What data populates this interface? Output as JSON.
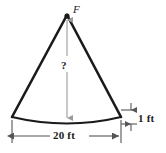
{
  "figure": {
    "kind": "geometry-diagram",
    "colors": {
      "background": "#ffffff",
      "outline": "#1a1a1a",
      "dimension_line": "#9a9a9a",
      "text": "#1a1a1a"
    },
    "labels": {
      "apex_point": "F",
      "height_dimension": "?",
      "base_dimension": "20 ft",
      "sagitta_dimension": "1 ft"
    },
    "geometry": {
      "apex": {
        "x": 67,
        "y": 15
      },
      "left_vertex": {
        "x": 12,
        "y": 117
      },
      "right_vertex": {
        "x": 121,
        "y": 117
      },
      "arc_lowest": {
        "x": 67,
        "y": 123
      },
      "base_dimension_y": 136,
      "sagitta_top_y": 110,
      "sagitta_bottom_y": 124,
      "sagitta_x": 131
    }
  },
  "icons": {
    "apex_marker": "vertex-dot",
    "arrow_head": "dimension-arrowhead"
  }
}
